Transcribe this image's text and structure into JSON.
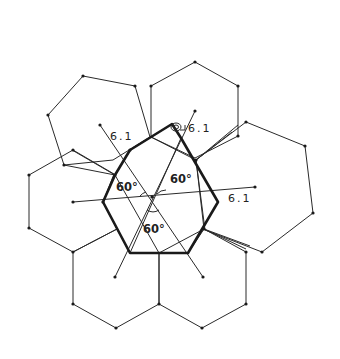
{
  "figure": {
    "labels": {
      "length_top_left": "6.1",
      "length_top_right": "6.1",
      "length_right": "6.1",
      "angle_left": "60°",
      "angle_right": "60°",
      "angle_bottom": "60°"
    },
    "colors": {
      "stroke": "#2a2a2a",
      "background": "#ffffff"
    },
    "hexagon_count": 7,
    "icons": {
      "rotation_marker": "spiral-rotation-icon"
    }
  }
}
